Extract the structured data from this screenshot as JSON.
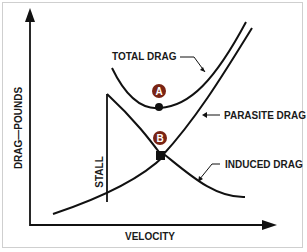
{
  "diagram": {
    "x_axis_label": "VELOCITY",
    "y_axis_label": "DRAG—POUNDS",
    "curves": [
      {
        "name": "total-drag",
        "label": "TOTAL DRAG"
      },
      {
        "name": "parasite-drag",
        "label": "PARASITE DRAG"
      },
      {
        "name": "induced-drag",
        "label": "INDUCED DRAG"
      }
    ],
    "stall_label": "STALL",
    "points": [
      {
        "id": "A",
        "label": "A",
        "description": "Minimum total drag"
      },
      {
        "id": "B",
        "label": "B",
        "description": "Induced drag equals parasite drag"
      }
    ],
    "colors": {
      "line": "#111111",
      "badge": "#7a2414",
      "frame": "#cfcfcf"
    }
  }
}
